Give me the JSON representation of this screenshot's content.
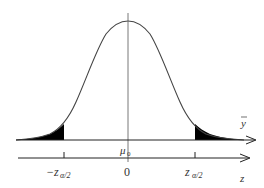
{
  "diagram": {
    "type": "normal-distribution-two-tailed-test",
    "axes": {
      "upper": {
        "label": "y",
        "label_decoration": "bar"
      },
      "lower": {
        "label": "z"
      }
    },
    "labels": {
      "mean": "μ",
      "mean_subscript": "0",
      "center_tick": "0",
      "left_critical": "−z",
      "left_critical_subscript": "α/2",
      "right_critical": "z",
      "right_critical_subscript": "α/2"
    },
    "shaded_regions": [
      "left tail beyond −z_α/2",
      "right tail beyond z_α/2"
    ],
    "colors": {
      "curve": "#444444",
      "fill": "#000000",
      "axis": "#222222"
    }
  }
}
